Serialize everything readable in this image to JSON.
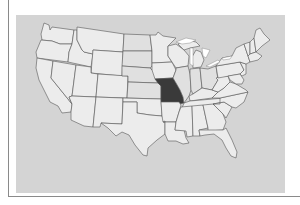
{
  "map": {
    "title": "",
    "subject": "United States map",
    "highlighted_state": "Missouri",
    "colors": {
      "background": "#d4d4d4",
      "state_fill": "#ececec",
      "highlight_fill": "#3a3a3a",
      "border": "#555555"
    },
    "states": [
      "WA",
      "OR",
      "CA",
      "NV",
      "ID",
      "MT",
      "WY",
      "UT",
      "AZ",
      "CO",
      "NM",
      "ND",
      "SD",
      "NE",
      "KS",
      "OK",
      "TX",
      "MN",
      "IA",
      "MO",
      "AR",
      "LA",
      "WI",
      "IL",
      "MI",
      "IN",
      "OH",
      "KY",
      "TN",
      "MS",
      "AL",
      "GA",
      "FL",
      "SC",
      "NC",
      "VA",
      "WV",
      "PA",
      "NY",
      "ME",
      "VT",
      "NH",
      "MA",
      "NJ",
      "MD"
    ]
  }
}
